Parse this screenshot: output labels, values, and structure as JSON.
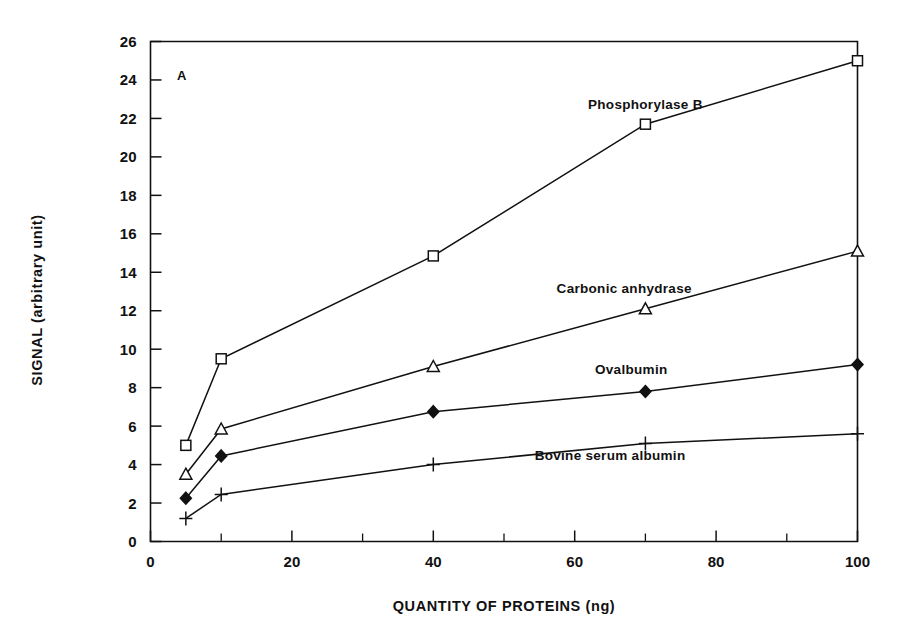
{
  "figure": {
    "panel_label": "A"
  },
  "chart_data": {
    "type": "line",
    "title": "",
    "subtitle": "",
    "xlabel": "QUANTITY OF PROTEINS (ng)",
    "ylabel": "SIGNAL (arbitrary unit)",
    "xlim": [
      0,
      100
    ],
    "ylim": [
      0,
      26
    ],
    "xticks": [
      0,
      20,
      40,
      60,
      80,
      100
    ],
    "xtick_labels": [
      "0",
      "20",
      "40",
      "60",
      "80",
      "100"
    ],
    "xminor_ticks": [
      10,
      30,
      50,
      70,
      90
    ],
    "yticks": [
      0,
      2,
      4,
      6,
      8,
      10,
      12,
      14,
      16,
      18,
      20,
      22,
      24,
      26
    ],
    "ytick_labels": [
      "0",
      "2",
      "4",
      "6",
      "8",
      "10",
      "12",
      "14",
      "16",
      "18",
      "20",
      "22",
      "24",
      "26"
    ],
    "grid": false,
    "legend_position": "inline-annotations",
    "x": [
      5,
      10,
      40,
      70,
      100
    ],
    "series": [
      {
        "name": "Phosphorylase B",
        "marker": "open-square",
        "color": "#111111",
        "values": [
          5.0,
          9.5,
          14.85,
          21.7,
          25.0
        ],
        "label_x": 70,
        "label_y": 22.5
      },
      {
        "name": "Carbonic anhydrase",
        "marker": "open-triangle",
        "color": "#111111",
        "values": [
          3.5,
          5.85,
          9.1,
          12.1,
          15.1
        ],
        "label_x": 67,
        "label_y": 12.9
      },
      {
        "name": "Ovalbumin",
        "marker": "filled-diamond",
        "color": "#111111",
        "values": [
          2.25,
          4.45,
          6.75,
          7.8,
          9.2
        ],
        "label_x": 68,
        "label_y": 8.7
      },
      {
        "name": "Bovine serum albumin",
        "marker": "plus",
        "color": "#111111",
        "values": [
          1.2,
          2.45,
          4.0,
          5.1,
          5.6
        ],
        "label_x": 65,
        "label_y": 4.25
      }
    ]
  }
}
